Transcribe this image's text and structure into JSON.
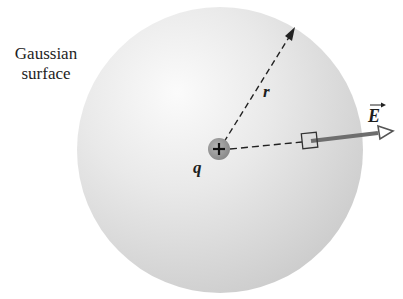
{
  "figure": {
    "surface_label_line1": "Gaussian",
    "surface_label_line2": "surface",
    "charge_label": "q",
    "charge_sign": "+",
    "radius_label": "r",
    "field_label": "E",
    "field_vector_arrow": "→"
  },
  "colors": {
    "sphere_light": "#f7f7f7",
    "sphere_dark": "#cfcfcf",
    "charge_fill": "#9a9a9a",
    "field_arrow": "#6e6e6e",
    "text": "#1e1e1e"
  }
}
